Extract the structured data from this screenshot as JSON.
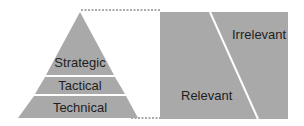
{
  "pyramid": {
    "levels": [
      {
        "label": "Strategic"
      },
      {
        "label": "Tactical"
      },
      {
        "label": "Technical"
      }
    ]
  },
  "panel": {
    "regions": [
      {
        "label": "Irrelevant"
      },
      {
        "label": "Relevant"
      }
    ]
  },
  "colors": {
    "fill": "#a9a9a9",
    "separator": "#ffffff",
    "text": "#1e1e1e",
    "connector": "#555555"
  }
}
